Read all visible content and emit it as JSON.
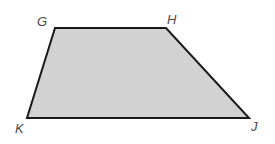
{
  "figure": {
    "name": "trapezoid-GHJK",
    "shape_type": "trapezoid",
    "background_color": "#ffffff",
    "fill_color": "#d2d2d2",
    "stroke_color": "#1a1a1a",
    "stroke_width": 2,
    "canvas": {
      "width": 275,
      "height": 144
    },
    "polygon_points": "55,28 166,28 249,118 27,118",
    "vertices": [
      {
        "id": "G",
        "label": "G",
        "x": 55,
        "y": 28,
        "label_x": 37,
        "label_y": 15
      },
      {
        "id": "H",
        "label": "H",
        "x": 166,
        "y": 28,
        "label_x": 167,
        "label_y": 13
      },
      {
        "id": "J",
        "label": "J",
        "x": 249,
        "y": 118,
        "label_x": 251,
        "label_y": 120
      },
      {
        "id": "K",
        "label": "K",
        "x": 27,
        "y": 118,
        "label_x": 15,
        "label_y": 122
      }
    ],
    "edges": [
      {
        "id": "GH",
        "from": "G",
        "to": "H"
      },
      {
        "id": "HJ",
        "from": "H",
        "to": "J"
      },
      {
        "id": "JK",
        "from": "J",
        "to": "K"
      },
      {
        "id": "KG",
        "from": "K",
        "to": "G"
      }
    ],
    "label_color": "#4a4a4a"
  }
}
